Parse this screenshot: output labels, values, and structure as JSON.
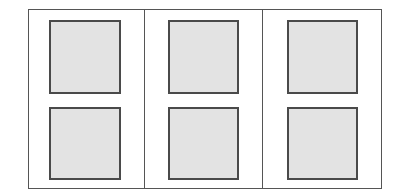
{
  "diagram": {
    "type": "grid-layout",
    "columns": 3,
    "rows": 2,
    "colors": {
      "frame": "#555555",
      "panel_fill": "#e3e3e3",
      "panel_border": "#4a4a4a",
      "background": "#ffffff"
    },
    "frame": {
      "x": 28,
      "y": 9,
      "w": 354,
      "h": 180
    },
    "dividers_x": [
      144,
      262
    ],
    "panels": [
      {
        "col": 0,
        "row": 0,
        "x": 49,
        "y": 20,
        "w": 71,
        "h": 73
      },
      {
        "col": 1,
        "row": 0,
        "x": 168,
        "y": 20,
        "w": 70,
        "h": 73
      },
      {
        "col": 2,
        "row": 0,
        "x": 287,
        "y": 20,
        "w": 70,
        "h": 73
      },
      {
        "col": 0,
        "row": 1,
        "x": 49,
        "y": 107,
        "w": 71,
        "h": 72
      },
      {
        "col": 1,
        "row": 1,
        "x": 168,
        "y": 107,
        "w": 70,
        "h": 72
      },
      {
        "col": 2,
        "row": 1,
        "x": 287,
        "y": 107,
        "w": 70,
        "h": 72
      }
    ]
  }
}
